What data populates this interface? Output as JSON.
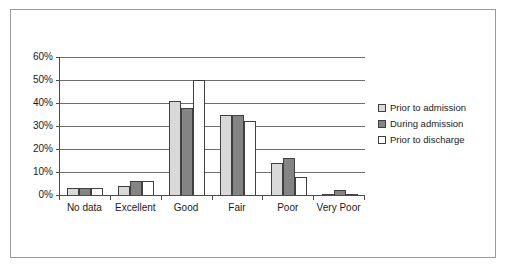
{
  "chart_data": {
    "type": "bar",
    "title": "",
    "subtitle": "",
    "xlabel": "",
    "ylabel": "",
    "categories": [
      "No data",
      "Excellent",
      "Good",
      "Fair",
      "Poor",
      "Very Poor"
    ],
    "series": [
      {
        "name": "Prior to admission",
        "color": "#d9d9d9",
        "values": [
          3,
          4,
          41,
          35,
          14,
          0.5
        ]
      },
      {
        "name": "During admission",
        "color": "#848484",
        "values": [
          3,
          6,
          38,
          35,
          16,
          2
        ]
      },
      {
        "name": "Prior to discharge",
        "color": "#ffffff",
        "values": [
          3,
          6,
          50,
          32,
          8,
          0.5
        ]
      }
    ],
    "ylim": [
      0,
      60
    ],
    "y_ticks": [
      0,
      10,
      20,
      30,
      40,
      50,
      60
    ],
    "y_tick_labels": [
      "0%",
      "10%",
      "20%",
      "30%",
      "40%",
      "50%",
      "60%"
    ],
    "y_tick_suffix": "%",
    "grid": true,
    "grid_axis": "y",
    "legend_position": "right",
    "legend_entries": [
      "Prior to admission",
      "During admission",
      "Prior to discharge"
    ],
    "bar_border_color": "#3f3f3f",
    "axis_color": "#4c4c4c",
    "gridline_color": "#6e6e6e",
    "frame_color": "#9a9a9a",
    "background_color": "#ffffff"
  }
}
